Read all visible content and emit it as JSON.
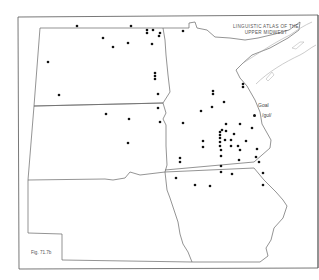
{
  "title": {
    "line1": "LINGUISTIC ATLAS OF THE",
    "line2": "UPPER MIDWEST"
  },
  "legend": {
    "heading": "Goal",
    "value": "/gʊl/",
    "symbol": "dot"
  },
  "figure_label": "Fig. 71.7b",
  "colors": {
    "border": "#555555",
    "lake": "#999999",
    "dot": "#111111"
  },
  "points": [
    [
      77,
      26
    ],
    [
      103,
      38
    ],
    [
      131,
      26
    ],
    [
      147,
      30
    ],
    [
      147,
      33
    ],
    [
      153,
      30
    ],
    [
      183,
      31
    ],
    [
      160,
      33
    ],
    [
      159,
      36
    ],
    [
      128,
      43
    ],
    [
      152,
      44
    ],
    [
      113,
      47
    ],
    [
      48,
      62
    ],
    [
      155,
      73
    ],
    [
      155,
      76
    ],
    [
      155,
      79
    ],
    [
      158,
      94
    ],
    [
      59,
      95
    ],
    [
      158,
      108
    ],
    [
      106,
      114
    ],
    [
      129,
      119
    ],
    [
      128,
      143
    ],
    [
      160,
      122
    ],
    [
      183,
      123
    ],
    [
      224,
      102
    ],
    [
      213,
      91
    ],
    [
      213,
      94
    ],
    [
      252,
      128
    ],
    [
      201,
      111
    ],
    [
      212,
      107
    ],
    [
      243,
      84
    ],
    [
      243,
      87
    ],
    [
      226,
      124
    ],
    [
      222,
      130
    ],
    [
      226,
      131
    ],
    [
      220,
      132
    ],
    [
      220,
      135
    ],
    [
      220,
      138
    ],
    [
      220,
      142
    ],
    [
      220,
      146
    ],
    [
      225,
      140
    ],
    [
      231,
      140
    ],
    [
      231,
      146
    ],
    [
      234,
      134
    ],
    [
      263,
      173
    ],
    [
      240,
      150
    ],
    [
      203,
      141
    ],
    [
      203,
      147
    ],
    [
      221,
      150
    ],
    [
      221,
      156
    ],
    [
      180,
      158
    ],
    [
      180,
      162
    ],
    [
      221,
      166
    ],
    [
      221,
      172
    ],
    [
      240,
      124
    ],
    [
      238,
      146
    ],
    [
      246,
      141
    ],
    [
      257,
      149
    ],
    [
      256,
      157
    ],
    [
      259,
      162
    ],
    [
      195,
      185
    ],
    [
      176,
      178
    ],
    [
      210,
      186
    ],
    [
      232,
      174
    ],
    [
      239,
      160
    ],
    [
      263,
      185
    ]
  ]
}
